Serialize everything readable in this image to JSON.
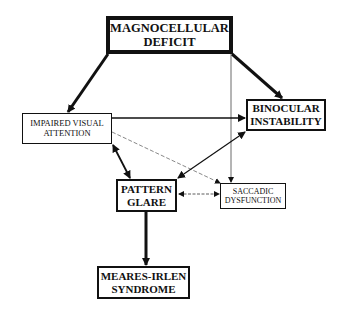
{
  "diagram": {
    "nodes": {
      "magno": {
        "line1": "MAGNOCELLULAR",
        "line2": "DEFICIT"
      },
      "impaired": {
        "line1": "IMPAIRED VISUAL",
        "line2": "ATTENTION"
      },
      "binocular": {
        "line1": "BINOCULAR",
        "line2": "INSTABILITY"
      },
      "pattern": {
        "line1": "PATTERN",
        "line2": "GLARE"
      },
      "saccadic": {
        "line1": "SACCADIC",
        "line2": "DYSFUNCTION"
      },
      "meares": {
        "line1": "MEARES-IRLEN",
        "line2": "SYNDROME"
      }
    },
    "edges": [
      {
        "from": "MAGNOCELLULAR DEFICIT",
        "to": "IMPAIRED VISUAL ATTENTION",
        "style": "thick"
      },
      {
        "from": "MAGNOCELLULAR DEFICIT",
        "to": "BINOCULAR INSTABILITY",
        "style": "thick"
      },
      {
        "from": "MAGNOCELLULAR DEFICIT",
        "to": "SACCADIC DYSFUNCTION",
        "style": "thin"
      },
      {
        "from": "IMPAIRED VISUAL ATTENTION",
        "to": "BINOCULAR INSTABILITY",
        "style": "medium"
      },
      {
        "from": "IMPAIRED VISUAL ATTENTION",
        "to": "SACCADIC DYSFUNCTION",
        "style": "dashed"
      },
      {
        "from": "IMPAIRED VISUAL ATTENTION",
        "to": "PATTERN GLARE",
        "style": "medium",
        "bidirectional": true
      },
      {
        "from": "BINOCULAR INSTABILITY",
        "to": "PATTERN GLARE",
        "style": "medium",
        "bidirectional": true
      },
      {
        "from": "PATTERN GLARE",
        "to": "SACCADIC DYSFUNCTION",
        "style": "thin-dashed",
        "bidirectional": true
      },
      {
        "from": "PATTERN GLARE",
        "to": "MEARES-IRLEN SYNDROME",
        "style": "thick"
      }
    ]
  }
}
